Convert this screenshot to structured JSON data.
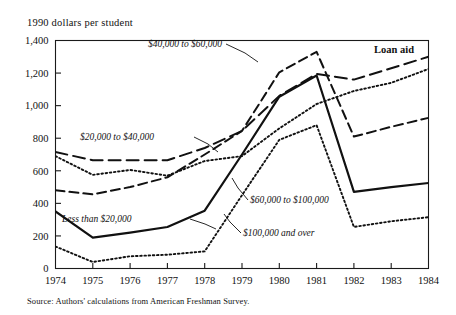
{
  "figure": {
    "y_axis_caption": "1990 dollars per student",
    "source_note": "Source: Authors' calculations from American Freshman Survey.",
    "panel_label": "Loan aid"
  },
  "chart_data": {
    "type": "line",
    "title": "Loan aid",
    "xlabel": "",
    "ylabel": "1990 dollars per student",
    "x": [
      1974,
      1975,
      1976,
      1977,
      1978,
      1979,
      1980,
      1981,
      1982,
      1983,
      1984
    ],
    "xtick_labels": [
      "1974",
      "1975",
      "1976",
      "1977",
      "1978",
      "1979",
      "1980",
      "1981",
      "1982",
      "1983",
      "1984"
    ],
    "ytick_labels": [
      "0",
      "200",
      "400",
      "600",
      "800",
      "1,000",
      "1,200",
      "1,400"
    ],
    "yticks": [
      0,
      200,
      400,
      600,
      800,
      1000,
      1200,
      1400
    ],
    "ylim": [
      0,
      1400
    ],
    "xlim": [
      1974,
      1984
    ],
    "grid": false,
    "legend": "inline-annotations",
    "series": [
      {
        "name": "$20,000 to $40,000",
        "style": "long-dash",
        "label_position": "left-upper",
        "values": [
          715,
          665,
          665,
          665,
          740,
          845,
          1060,
          1195,
          1160,
          1230,
          1300
        ]
      },
      {
        "name": "$40,000 to $60,000",
        "style": "medium-dash",
        "label_position": "top-center",
        "values": [
          480,
          455,
          500,
          560,
          700,
          845,
          1205,
          1330,
          810,
          870,
          925
        ]
      },
      {
        "name": "Less than $20,000",
        "style": "fine-dot",
        "label_position": "center-right",
        "values": [
          690,
          575,
          605,
          570,
          660,
          690,
          860,
          1010,
          1090,
          1140,
          1225
        ]
      },
      {
        "name": "$60,000 to $100,000",
        "style": "solid",
        "label_position": "left-lower",
        "values": [
          350,
          190,
          220,
          255,
          355,
          700,
          1055,
          1185,
          470,
          500,
          525
        ]
      },
      {
        "name": "$100,000 and over",
        "style": "fine-dot",
        "label_position": "center-lower",
        "values": [
          135,
          40,
          75,
          85,
          105,
          450,
          790,
          880,
          255,
          290,
          315
        ]
      }
    ],
    "annotations": [
      {
        "text": "$40,000 to $60,000",
        "anchor_x": 1979.05,
        "anchor_y": 1345
      },
      {
        "text": "$20,000 to $40,000",
        "anchor_x": 1975.1,
        "anchor_y": 815
      },
      {
        "text": "$60,000 to $100,000",
        "anchor_x": 1974.75,
        "anchor_y": 330
      },
      {
        "text": "Less than $20,000",
        "anchor_x": 1979.4,
        "anchor_y": 455
      },
      {
        "text": "$100,000 and over",
        "anchor_x": 1979.3,
        "anchor_y": 300
      },
      {
        "text": "Loan aid",
        "anchor_x": 1982.6,
        "anchor_y": 1335
      }
    ]
  }
}
